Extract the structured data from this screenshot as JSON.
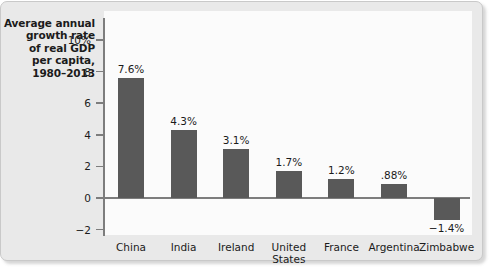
{
  "chart_data": {
    "type": "bar",
    "title": "Average annual growth rate of real GDP per capita, 1980–2013",
    "title_lines": [
      "Average annual",
      "growth rate",
      "of real GDP",
      "per capita,",
      "1980–2013"
    ],
    "xlabel": "",
    "ylabel": "",
    "ylim": [
      -2,
      10
    ],
    "yticks": [
      10,
      8,
      6,
      4,
      2,
      0,
      -2
    ],
    "ytick_labels": [
      "10%",
      "8",
      "6",
      "4",
      "2",
      "0",
      "−2"
    ],
    "grid": false,
    "legend": "none",
    "bar_color": "#595959",
    "panel_color": "#fbfbfb",
    "frame_color": "#e9e9e9",
    "axis_color": "#7d7d7d",
    "categories": [
      "China",
      "India",
      "Ireland",
      "United States",
      "France",
      "Argentina",
      "Zimbabwe"
    ],
    "category_lines": [
      [
        "China"
      ],
      [
        "India"
      ],
      [
        "Ireland"
      ],
      [
        "United",
        "States"
      ],
      [
        "France"
      ],
      [
        "Argentina"
      ],
      [
        "Zimbabwe"
      ]
    ],
    "values": [
      7.6,
      4.3,
      3.1,
      1.7,
      1.2,
      0.88,
      -1.4
    ],
    "value_labels": [
      "7.6%",
      "4.3%",
      "3.1%",
      "1.7%",
      "1.2%",
      ".88%",
      "−1.4%"
    ]
  }
}
